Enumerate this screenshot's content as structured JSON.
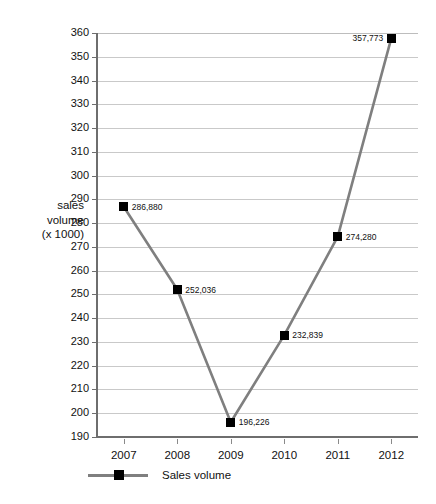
{
  "chart_data": {
    "type": "line",
    "title": "",
    "xlabel": "",
    "ylabel": "sales volume (x 1000)",
    "ylabel_lines": [
      "sales",
      "volume",
      "(x 1000)"
    ],
    "categories": [
      "2007",
      "2008",
      "2009",
      "2010",
      "2011",
      "2012"
    ],
    "values": [
      286.88,
      252.036,
      196.226,
      232.839,
      274.28,
      357.773
    ],
    "point_labels": [
      "286,880",
      "252,036",
      "196,226",
      "232,839",
      "274,280",
      "357,773"
    ],
    "label_sides": [
      "right",
      "right",
      "right",
      "right",
      "right",
      "left"
    ],
    "ylim": [
      190,
      360
    ],
    "ytick_step": 10,
    "yticks": [
      190,
      200,
      210,
      220,
      230,
      240,
      250,
      260,
      270,
      280,
      290,
      300,
      310,
      320,
      330,
      340,
      350,
      360
    ],
    "ytick_labels": [
      "190",
      "200",
      "210",
      "220",
      "230",
      "240",
      "250",
      "260",
      "270",
      "280",
      "290",
      "300",
      "310",
      "320",
      "330",
      "340",
      "350",
      "360"
    ],
    "grid": "horizontal",
    "legend_position": "bottom-left",
    "series": [
      {
        "name": "Sales volume",
        "values": [
          286.88,
          252.036,
          196.226,
          232.839,
          274.28,
          357.773
        ],
        "line_color": "#7f7f7f",
        "marker_color": "#000000",
        "marker": "square"
      }
    ]
  },
  "legend": {
    "entries": [
      {
        "label": "Sales volume"
      }
    ]
  },
  "colors": {
    "line": "#7f7f7f",
    "marker": "#000000",
    "grid": "#c9c9c9",
    "axis": "#6e6e6e",
    "text": "#111111",
    "background": "#ffffff"
  }
}
